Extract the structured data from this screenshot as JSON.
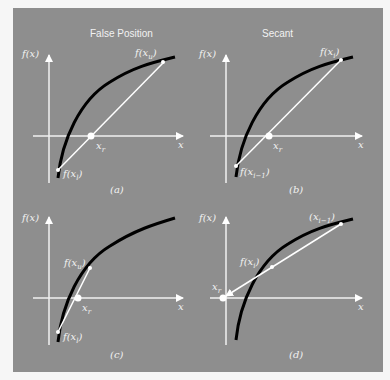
{
  "figure": {
    "background_color": "#8e8e8e",
    "curve_color": "#000000",
    "line_color": "#ffffff",
    "panels": [
      {
        "id": "a",
        "title": "False Position",
        "caption": "(a)",
        "y_axis_label": "f(x)",
        "x_axis_label": "x",
        "root_label": "x",
        "root_subscript": "r",
        "upper_label": "f(x",
        "upper_subscript": "u",
        "lower_label": "f(x",
        "lower_subscript": "l"
      },
      {
        "id": "b",
        "title": "Secant",
        "caption": "(b)",
        "y_axis_label": "f(x)",
        "x_axis_label": "x",
        "root_label": "x",
        "root_subscript": "r",
        "upper_label": "f(x",
        "upper_subscript": "i",
        "lower_label": "f(x",
        "lower_subscript": "i−1"
      },
      {
        "id": "c",
        "title": "",
        "caption": "(c)",
        "y_axis_label": "f(x)",
        "x_axis_label": "x",
        "root_label": "x",
        "root_subscript": "r",
        "upper_label": "f(x",
        "upper_subscript": "u",
        "lower_label": "f(x",
        "lower_subscript": "l"
      },
      {
        "id": "d",
        "title": "",
        "caption": "(d)",
        "y_axis_label": "f(x)",
        "x_axis_label": "x",
        "root_label": "x",
        "root_subscript": "r",
        "upper_label": "(x",
        "upper_subscript": "i−1",
        "lower_label": "f(x",
        "lower_subscript": "i"
      }
    ],
    "close_paren": ")"
  }
}
